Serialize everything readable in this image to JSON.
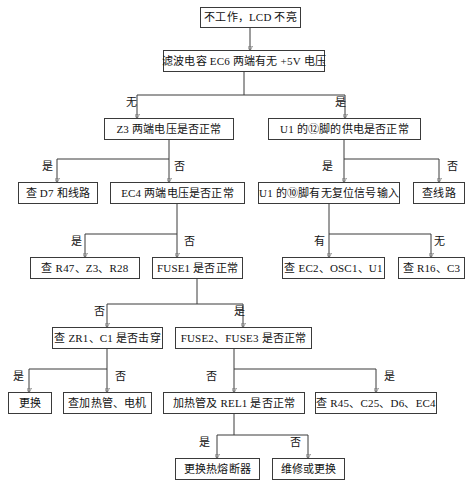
{
  "diagram": {
    "type": "flowchart",
    "background_color": "#ffffff",
    "box_border_color": "#3a3a3a",
    "wire_color": "#3a3a3a",
    "text_color": "#111111"
  },
  "nodes": [
    {
      "id": "n1",
      "label": "不工作，LCD 不亮",
      "x": 200,
      "y": 7,
      "w": 101,
      "h": 21
    },
    {
      "id": "n2",
      "label": "滤波电容 EC6 两端有无 +5V 电压",
      "x": 163,
      "y": 50,
      "w": 162,
      "h": 22
    },
    {
      "id": "n3",
      "label": "Z3 两端电压是否正常",
      "x": 104,
      "y": 118,
      "w": 130,
      "h": 22
    },
    {
      "id": "n4",
      "label": "U1 的⑫脚的供电是否正常",
      "x": 268,
      "y": 118,
      "w": 153,
      "h": 22
    },
    {
      "id": "n5",
      "label": "查 D7 和线路",
      "x": 18,
      "y": 182,
      "w": 80,
      "h": 22
    },
    {
      "id": "n6",
      "label": "EC4 两端电压是否正常",
      "x": 110,
      "y": 182,
      "w": 135,
      "h": 22
    },
    {
      "id": "n7",
      "label": "U1 的⑩脚有无复位信号输入",
      "x": 258,
      "y": 182,
      "w": 142,
      "h": 22
    },
    {
      "id": "n8",
      "label": "查线路",
      "x": 413,
      "y": 182,
      "w": 52,
      "h": 22
    },
    {
      "id": "n9",
      "label": "查 R47、Z3、R28",
      "x": 30,
      "y": 257,
      "w": 110,
      "h": 22
    },
    {
      "id": "n10",
      "label": "FUSE1 是否正常",
      "x": 152,
      "y": 257,
      "w": 91,
      "h": 22
    },
    {
      "id": "n11",
      "label": "查 EC2、OSC1、U1",
      "x": 282,
      "y": 257,
      "w": 103,
      "h": 22
    },
    {
      "id": "n12",
      "label": "查 R16、C3",
      "x": 398,
      "y": 257,
      "w": 67,
      "h": 22
    },
    {
      "id": "n13",
      "label": "查 ZR1、C1 是否击穿",
      "x": 52,
      "y": 327,
      "w": 111,
      "h": 22
    },
    {
      "id": "n14",
      "label": "FUSE2、FUSE3 是否正常",
      "x": 175,
      "y": 327,
      "w": 137,
      "h": 22
    },
    {
      "id": "n15",
      "label": "更换",
      "x": 8,
      "y": 392,
      "w": 44,
      "h": 22
    },
    {
      "id": "n16",
      "label": "查加热管、电机",
      "x": 63,
      "y": 392,
      "w": 89,
      "h": 22
    },
    {
      "id": "n17",
      "label": "加热管及 REL1 是否正常",
      "x": 163,
      "y": 392,
      "w": 142,
      "h": 22
    },
    {
      "id": "n18",
      "label": "查 R45、C25、D6、EC4",
      "x": 315,
      "y": 392,
      "w": 122,
      "h": 22
    },
    {
      "id": "n19",
      "label": "更换热熔断器",
      "x": 175,
      "y": 458,
      "w": 85,
      "h": 22
    },
    {
      "id": "n20",
      "label": "维修或更换",
      "x": 272,
      "y": 458,
      "w": 73,
      "h": 22
    }
  ],
  "edge_labels": [
    {
      "id": "e1",
      "text": "无",
      "x": 126,
      "y": 97
    },
    {
      "id": "e2",
      "text": "是",
      "x": 335,
      "y": 97
    },
    {
      "id": "e3",
      "text": "是",
      "x": 42,
      "y": 161
    },
    {
      "id": "e4",
      "text": "否",
      "x": 174,
      "y": 161
    },
    {
      "id": "e5",
      "text": "是",
      "x": 322,
      "y": 161
    },
    {
      "id": "e6",
      "text": "否",
      "x": 447,
      "y": 161
    },
    {
      "id": "e7",
      "text": "是",
      "x": 71,
      "y": 236
    },
    {
      "id": "e8",
      "text": "否",
      "x": 184,
      "y": 236
    },
    {
      "id": "e9",
      "text": "有",
      "x": 314,
      "y": 236
    },
    {
      "id": "e10",
      "text": "无",
      "x": 434,
      "y": 236
    },
    {
      "id": "e11",
      "text": "否",
      "x": 94,
      "y": 306
    },
    {
      "id": "e12",
      "text": "是",
      "x": 234,
      "y": 306
    },
    {
      "id": "e13",
      "text": "是",
      "x": 13,
      "y": 371
    },
    {
      "id": "e14",
      "text": "否",
      "x": 115,
      "y": 371
    },
    {
      "id": "e15",
      "text": "否",
      "x": 206,
      "y": 371
    },
    {
      "id": "e16",
      "text": "是",
      "x": 384,
      "y": 371
    },
    {
      "id": "e17",
      "text": "是",
      "x": 199,
      "y": 437
    },
    {
      "id": "e18",
      "text": "否",
      "x": 290,
      "y": 437
    }
  ],
  "flow": {
    "decisions": [
      {
        "question": "滤波电容 EC6 两端有无 +5V 电压",
        "branches": [
          {
            "answer": "无",
            "next": "Z3 两端电压是否正常"
          },
          {
            "answer": "是",
            "next": "U1 的⑫脚的供电是否正常"
          }
        ]
      },
      {
        "question": "Z3 两端电压是否正常",
        "branches": [
          {
            "answer": "是",
            "next": "查 D7 和线路"
          },
          {
            "answer": "否",
            "next": "EC4 两端电压是否正常"
          }
        ]
      },
      {
        "question": "U1 的⑫脚的供电是否正常",
        "branches": [
          {
            "answer": "是",
            "next": "U1 的⑩脚有无复位信号输入"
          },
          {
            "answer": "否",
            "next": "查线路"
          }
        ]
      },
      {
        "question": "EC4 两端电压是否正常",
        "branches": [
          {
            "answer": "是",
            "next": "查 R47、Z3、R28"
          },
          {
            "answer": "否",
            "next": "FUSE1 是否正常"
          }
        ]
      },
      {
        "question": "U1 的⑩脚有无复位信号输入",
        "branches": [
          {
            "answer": "有",
            "next": "查 EC2、OSC1、U1"
          },
          {
            "answer": "无",
            "next": "查 R16、C3"
          }
        ]
      },
      {
        "question": "FUSE1 是否正常",
        "branches": [
          {
            "answer": "否",
            "next": "查 ZR1、C1 是否击穿"
          },
          {
            "answer": "是",
            "next": "FUSE2、FUSE3 是否正常"
          }
        ]
      },
      {
        "question": "查 ZR1、C1 是否击穿",
        "branches": [
          {
            "answer": "是",
            "next": "更换"
          },
          {
            "answer": "否",
            "next": "查加热管、电机"
          }
        ]
      },
      {
        "question": "FUSE2、FUSE3 是否正常",
        "branches": [
          {
            "answer": "否",
            "next": "加热管及 REL1 是否正常"
          },
          {
            "answer": "是",
            "next": "查 R45、C25、D6、EC4"
          }
        ]
      },
      {
        "question": "加热管及 REL1 是否正常",
        "branches": [
          {
            "answer": "是",
            "next": "更换热熔断器"
          },
          {
            "answer": "否",
            "next": "维修或更换"
          }
        ]
      }
    ]
  }
}
